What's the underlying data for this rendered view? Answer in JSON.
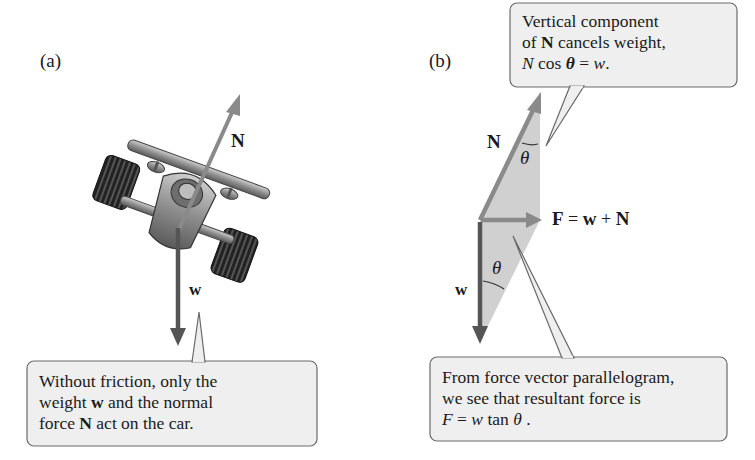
{
  "panels": {
    "a": {
      "label": "(a)",
      "vectors": {
        "normal": {
          "label": "N"
        },
        "weight": {
          "label": "w"
        }
      },
      "callout": {
        "line1": "Without friction, only the",
        "line2_pre": "weight ",
        "line2_bold": "w",
        "line2_post": " and the normal",
        "line3_pre": "force ",
        "line3_bold": "N",
        "line3_post": " act on the car."
      }
    },
    "b": {
      "label": "(b)",
      "vectors": {
        "normal": {
          "label": "N"
        },
        "weight": {
          "label": "w"
        },
        "resultant": {
          "label_F": "F",
          "eq": "=",
          "label_w": "w",
          "plus": "+",
          "label_N": "N"
        }
      },
      "angle_label_upper": "θ",
      "angle_label_lower": "θ",
      "callout_top": {
        "line1": "Vertical component",
        "line2_pre": "of ",
        "line2_bold": "N",
        "line2_post": " cancels weight,",
        "line3_N": "N",
        "line3_mid": " cos ",
        "line3_theta": "θ",
        "line3_eq": " = ",
        "line3_w": "w",
        "line3_end": "."
      },
      "callout_bottom": {
        "line1": "From force vector parallelogram,",
        "line2": "we see that resultant force is",
        "line3_F": "F",
        "line3_eq": " = ",
        "line3_w": "w",
        "line3_tan": " tan ",
        "line3_theta": "θ",
        "line3_end": " ."
      }
    }
  },
  "colors": {
    "normal_arrow": "#8a8a8a",
    "weight_arrow": "#555555",
    "shade": "#d0d0d0",
    "callout_fill": "#efefef",
    "callout_border": "#6a6a6a"
  }
}
